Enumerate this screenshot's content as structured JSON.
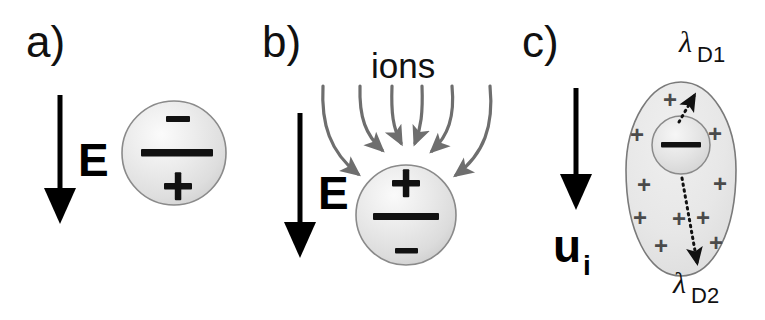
{
  "figure": {
    "background_color": "#ffffff",
    "width": 765,
    "height": 320
  },
  "colors": {
    "ink": "#111111",
    "arrow_black": "#000000",
    "ion_arrow_gray": "#6e6e6e",
    "sphere_fill_light": "#f2f2f2",
    "sphere_fill_mid": "#dcdcdc",
    "sphere_outline": "#8a8a8a",
    "charge_gray": "#4a4a4a",
    "cloud_fill": "#e9e9e9",
    "cloud_outline": "#7a7a7a",
    "dotted_arrow": "#111111"
  },
  "panels": [
    {
      "id": "a",
      "label": "a)",
      "field_arrow": {
        "name": "E",
        "label": "E",
        "direction": "down",
        "color": "#000000"
      },
      "particle": {
        "shape": "sphere",
        "top_charge": "–",
        "middle_bar": "—",
        "bottom_charge": "+",
        "polarity": "minus-top-plus-bottom"
      },
      "ion_arrows": [],
      "cloud": null
    },
    {
      "id": "b",
      "label": "b)",
      "field_arrow": {
        "name": "E",
        "label": "E",
        "direction": "down",
        "color": "#000000"
      },
      "particle": {
        "shape": "sphere",
        "top_charge": "+",
        "middle_bar": "—",
        "bottom_charge": "–",
        "polarity": "plus-top-minus-bottom"
      },
      "ion_arrows": {
        "label": "ions",
        "count": 6,
        "color": "#6e6e6e",
        "direction": "converging-downward"
      },
      "cloud": null
    },
    {
      "id": "c",
      "label": "c)",
      "field_arrow": {
        "name": "u_i",
        "label": "u",
        "subscript": "i",
        "direction": "down",
        "color": "#000000"
      },
      "particle": {
        "shape": "sphere",
        "middle_bar": "—",
        "polarity": "negative-core"
      },
      "cloud": {
        "shape": "egg",
        "charge_glyph": "+",
        "charge_count": 12,
        "fill": "#e9e9e9"
      },
      "debye_lengths": [
        {
          "id": "D1",
          "symbol": "λ",
          "subscript": "D1",
          "direction": "up",
          "style": "dotted-arrow"
        },
        {
          "id": "D2",
          "symbol": "λ",
          "subscript": "D2",
          "direction": "down",
          "style": "dotted-arrow"
        }
      ]
    }
  ]
}
